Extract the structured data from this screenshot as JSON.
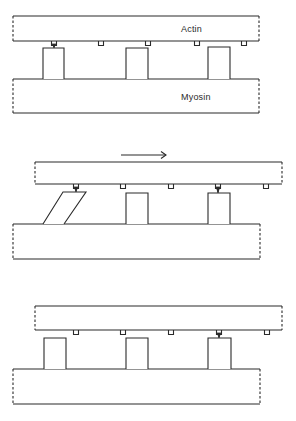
{
  "figure": {
    "labels": {
      "actin": "Actin",
      "myosin": "Myosin"
    },
    "stroke_color": "#2a2a2a",
    "background": "#ffffff"
  },
  "panels": [
    {
      "name": "panel-1-attached",
      "actin": {
        "x1": 13,
        "x2": 259,
        "y1": 16,
        "y2": 41,
        "label": "Actin"
      },
      "myosin": {
        "x1": 13,
        "x2": 259,
        "y1": 79,
        "y2": 113,
        "label": "Myosin"
      },
      "heads": [
        {
          "x1": 43,
          "x2": 64,
          "top": 48,
          "tilted": false,
          "attached": true
        },
        {
          "x1": 126,
          "x2": 148,
          "top": 48,
          "tilted": false,
          "attached": false
        },
        {
          "x1": 208,
          "x2": 230,
          "top": 47,
          "tilted": false,
          "attached": false
        }
      ],
      "sites": [
        54,
        101,
        148,
        197,
        244
      ],
      "attached_site": 54
    },
    {
      "name": "panel-2-power-stroke",
      "arrow": {
        "x1": 121,
        "x2": 166,
        "y": 155,
        "direction": "right"
      },
      "actin": {
        "x1": 35,
        "x2": 282,
        "y1": 162,
        "y2": 184
      },
      "myosin": {
        "x1": 13,
        "x2": 260,
        "y1": 224,
        "y2": 259
      },
      "heads": [
        {
          "top_x1": 63,
          "top_x2": 86,
          "bot_x1": 43,
          "bot_x2": 64,
          "top": 192,
          "tilted": true,
          "attached": true
        },
        {
          "x1": 126,
          "x2": 148,
          "top": 193,
          "tilted": false,
          "attached": false
        },
        {
          "x1": 208,
          "x2": 230,
          "top": 193,
          "tilted": false,
          "attached": true
        }
      ],
      "sites": [
        76,
        123,
        171,
        218,
        266
      ],
      "attached_sites": [
        76,
        218
      ]
    },
    {
      "name": "panel-3-reattached",
      "actin": {
        "x1": 35,
        "x2": 282,
        "y1": 306,
        "y2": 330
      },
      "myosin": {
        "x1": 13,
        "x2": 260,
        "y1": 369,
        "y2": 404
      },
      "heads": [
        {
          "x1": 44,
          "x2": 66,
          "top": 338,
          "tilted": false,
          "attached": false
        },
        {
          "x1": 126,
          "x2": 148,
          "top": 338,
          "tilted": false,
          "attached": false
        },
        {
          "x1": 208,
          "x2": 231,
          "top": 338,
          "tilted": false,
          "attached": true
        }
      ],
      "sites": [
        76,
        123,
        171,
        219,
        267
      ],
      "attached_site": 219
    }
  ]
}
